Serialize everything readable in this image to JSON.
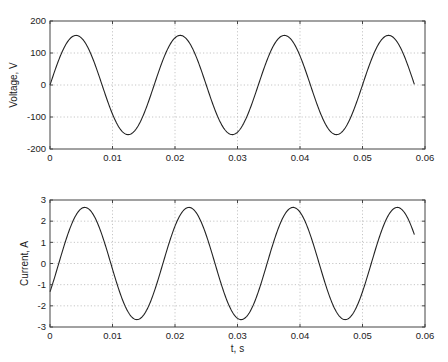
{
  "chart_data": [
    {
      "type": "line",
      "title": "",
      "xlabel": "",
      "ylabel": "Voltage, V",
      "xlim": [
        0,
        0.06
      ],
      "ylim": [
        -200,
        200
      ],
      "xticks": [
        0,
        0.01,
        0.02,
        0.03,
        0.04,
        0.05,
        0.06
      ],
      "xtick_labels": [
        "0",
        "0.01",
        "0.02",
        "0.03",
        "0.04",
        "0.05",
        "0.06"
      ],
      "yticks": [
        -200,
        -100,
        0,
        100,
        200
      ],
      "ytick_labels": [
        "-200",
        "-100",
        "0",
        "100",
        "200"
      ],
      "grid": true,
      "series": [
        {
          "name": "Voltage",
          "color": "#222222",
          "model": {
            "amplitude": 155,
            "frequency_hz": 60,
            "phase_delay_s": 0.0,
            "t_start": 0,
            "t_end": 0.0583
          },
          "x": [
            0,
            0.0042,
            0.0083,
            0.0125,
            0.0167,
            0.0208,
            0.025,
            0.0292,
            0.0333,
            0.0375,
            0.0417,
            0.0458,
            0.05,
            0.0542,
            0.0583
          ],
          "values": [
            0,
            155,
            0,
            -155,
            0,
            155,
            0,
            -155,
            0,
            155,
            0,
            -155,
            0,
            155,
            0
          ]
        }
      ]
    },
    {
      "type": "line",
      "title": "",
      "xlabel": "t, s",
      "ylabel": "Current, A",
      "xlim": [
        0,
        0.06
      ],
      "ylim": [
        -3,
        3
      ],
      "xticks": [
        0,
        0.01,
        0.02,
        0.03,
        0.04,
        0.05,
        0.06
      ],
      "xtick_labels": [
        "0",
        "0.01",
        "0.02",
        "0.03",
        "0.04",
        "0.05",
        "0.06"
      ],
      "yticks": [
        -3,
        -2,
        -1,
        0,
        1,
        2,
        3
      ],
      "ytick_labels": [
        "-3",
        "-2",
        "-1",
        "0",
        "1",
        "2",
        "3"
      ],
      "grid": true,
      "series": [
        {
          "name": "Current",
          "color": "#222222",
          "model": {
            "amplitude": 2.65,
            "frequency_hz": 60,
            "phase_delay_s": 0.0014,
            "t_start": 0,
            "t_end": 0.0583
          },
          "x": [
            0,
            0.0014,
            0.0056,
            0.0097,
            0.0139,
            0.0181,
            0.0222,
            0.0264,
            0.0306,
            0.0347,
            0.0389,
            0.0431,
            0.0472,
            0.0514,
            0.0556,
            0.0583
          ],
          "values": [
            -1.34,
            0,
            2.65,
            0,
            -2.65,
            0,
            2.65,
            0,
            -2.65,
            0,
            2.65,
            0,
            -2.65,
            0,
            2.65,
            1.4
          ]
        }
      ]
    }
  ],
  "layout": {
    "panels": [
      {
        "left": 50,
        "top": 21,
        "right": 425,
        "bottom": 149
      },
      {
        "left": 50,
        "top": 200,
        "right": 425,
        "bottom": 327
      }
    ]
  }
}
